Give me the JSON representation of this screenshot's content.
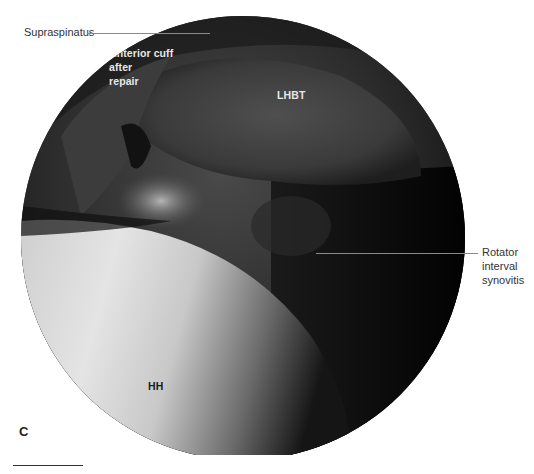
{
  "figure": {
    "panel_letter": "C",
    "labels": {
      "supraspinatus": "Supraspinatus",
      "anterior_cuff_line1": "Anterior cuff",
      "anterior_cuff_line2": "after",
      "anterior_cuff_line3": "repair",
      "lhbt": "LHBT",
      "rotator_line1": "Rotator",
      "rotator_line2": "interval",
      "rotator_line3": "synovitis",
      "hh": "HH"
    },
    "colors": {
      "background": "#ffffff",
      "scope_dark": "#050505",
      "scope_mid": "#3a3a3a",
      "humeral_head_light": "#e6e6e6",
      "leader_line": "#8a8a8a"
    }
  }
}
